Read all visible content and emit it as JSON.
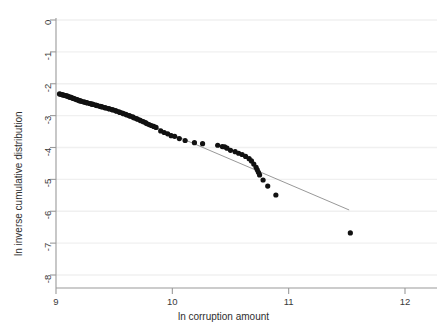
{
  "chart_data": {
    "type": "scatter",
    "title": "",
    "xlabel": "ln corruption amount",
    "ylabel": "ln inverse cumulative distribution",
    "xlim": [
      9,
      12
    ],
    "ylim": [
      -8,
      0
    ],
    "xticks": [
      9,
      10,
      11,
      12
    ],
    "xtick_labels": [
      "9",
      "10",
      "11",
      "12"
    ],
    "yticks": [
      0,
      -1,
      -2,
      -3,
      -4,
      -5,
      -6,
      -7,
      -8
    ],
    "ytick_labels": [
      "0",
      "-1",
      "-2",
      "-3",
      "-4",
      "-5",
      "-6",
      "-7",
      "-8"
    ],
    "grid": "horizontal-faint",
    "legend": "none",
    "series": [
      {
        "name": "observations",
        "type": "scatter",
        "marker": "filled-circle",
        "color": "#111111",
        "points": [
          [
            9.03,
            -2.32
          ],
          [
            9.04,
            -2.33
          ],
          [
            9.05,
            -2.34
          ],
          [
            9.06,
            -2.35
          ],
          [
            9.07,
            -2.36
          ],
          [
            9.08,
            -2.37
          ],
          [
            9.09,
            -2.38
          ],
          [
            9.1,
            -2.39
          ],
          [
            9.11,
            -2.41
          ],
          [
            9.12,
            -2.42
          ],
          [
            9.13,
            -2.43
          ],
          [
            9.14,
            -2.45
          ],
          [
            9.15,
            -2.46
          ],
          [
            9.16,
            -2.47
          ],
          [
            9.17,
            -2.49
          ],
          [
            9.18,
            -2.5
          ],
          [
            9.19,
            -2.51
          ],
          [
            9.2,
            -2.53
          ],
          [
            9.21,
            -2.54
          ],
          [
            9.22,
            -2.55
          ],
          [
            9.24,
            -2.57
          ],
          [
            9.25,
            -2.58
          ],
          [
            9.26,
            -2.59
          ],
          [
            9.27,
            -2.6
          ],
          [
            9.29,
            -2.62
          ],
          [
            9.3,
            -2.63
          ],
          [
            9.31,
            -2.64
          ],
          [
            9.32,
            -2.65
          ],
          [
            9.34,
            -2.67
          ],
          [
            9.35,
            -2.68
          ],
          [
            9.36,
            -2.69
          ],
          [
            9.38,
            -2.71
          ],
          [
            9.39,
            -2.72
          ],
          [
            9.4,
            -2.73
          ],
          [
            9.42,
            -2.75
          ],
          [
            9.43,
            -2.76
          ],
          [
            9.45,
            -2.78
          ],
          [
            9.46,
            -2.79
          ],
          [
            9.48,
            -2.81
          ],
          [
            9.49,
            -2.82
          ],
          [
            9.51,
            -2.84
          ],
          [
            9.52,
            -2.86
          ],
          [
            9.54,
            -2.88
          ],
          [
            9.55,
            -2.9
          ],
          [
            9.57,
            -2.92
          ],
          [
            9.58,
            -2.94
          ],
          [
            9.6,
            -2.96
          ],
          [
            9.61,
            -2.98
          ],
          [
            9.63,
            -3.0
          ],
          [
            9.64,
            -3.02
          ],
          [
            9.66,
            -3.04
          ],
          [
            9.67,
            -3.07
          ],
          [
            9.69,
            -3.09
          ],
          [
            9.7,
            -3.11
          ],
          [
            9.72,
            -3.14
          ],
          [
            9.73,
            -3.16
          ],
          [
            9.75,
            -3.19
          ],
          [
            9.77,
            -3.22
          ],
          [
            9.78,
            -3.25
          ],
          [
            9.8,
            -3.28
          ],
          [
            9.82,
            -3.31
          ],
          [
            9.84,
            -3.34
          ],
          [
            9.86,
            -3.37
          ],
          [
            9.9,
            -3.48
          ],
          [
            9.93,
            -3.53
          ],
          [
            9.96,
            -3.57
          ],
          [
            9.99,
            -3.63
          ],
          [
            10.02,
            -3.65
          ],
          [
            10.06,
            -3.72
          ],
          [
            10.11,
            -3.78
          ],
          [
            10.19,
            -3.85
          ],
          [
            10.26,
            -3.88
          ],
          [
            10.39,
            -3.93
          ],
          [
            10.43,
            -3.97
          ],
          [
            10.45,
            -3.98
          ],
          [
            10.47,
            -4.02
          ],
          [
            10.5,
            -4.09
          ],
          [
            10.54,
            -4.13
          ],
          [
            10.57,
            -4.18
          ],
          [
            10.6,
            -4.22
          ],
          [
            10.63,
            -4.28
          ],
          [
            10.66,
            -4.35
          ],
          [
            10.68,
            -4.42
          ],
          [
            10.7,
            -4.52
          ],
          [
            10.72,
            -4.62
          ],
          [
            10.73,
            -4.7
          ],
          [
            10.74,
            -4.78
          ],
          [
            10.75,
            -4.86
          ],
          [
            10.78,
            -5.02
          ],
          [
            10.82,
            -5.21
          ],
          [
            10.89,
            -5.49
          ],
          [
            11.53,
            -6.68
          ]
        ]
      },
      {
        "name": "fitted-power-law-line",
        "type": "line",
        "color": "#8c8c8c",
        "endpoints": [
          [
            9.66,
            -3.06
          ],
          [
            11.52,
            -5.96
          ]
        ],
        "slope": -1.56
      }
    ]
  },
  "axes": {
    "xtitle": "ln corruption amount",
    "ytitle": "ln inverse cumulative distribution"
  }
}
